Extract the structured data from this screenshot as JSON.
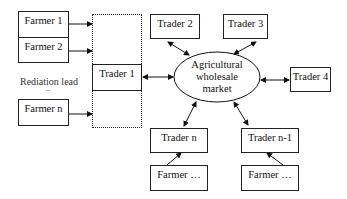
{
  "diagram": {
    "farmers_left": [
      {
        "label": "Farmer 1"
      },
      {
        "label": "Farmer 2"
      },
      {
        "label": "Farmer n"
      }
    ],
    "rediation_label": "Rediation lead",
    "ellipsis": "...",
    "center": {
      "line1": "Agricultural",
      "line2": "wholesale",
      "line3": "market"
    },
    "traders": {
      "t1": "Trader 1",
      "t2": "Trader 2",
      "t3": "Trader 3",
      "t4": "Trader 4",
      "tn": "Trader n",
      "tn1": "Trader n-1"
    },
    "farmers_bottom": [
      {
        "label": "Farmer …"
      },
      {
        "label": "Farmer …"
      }
    ]
  }
}
